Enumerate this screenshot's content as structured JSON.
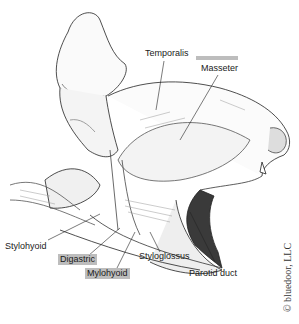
{
  "figure": {
    "labels": [
      {
        "id": "temporalis",
        "text": "Temporalis",
        "highlighted": false
      },
      {
        "id": "masseter",
        "text": "Masseter",
        "highlighted": true
      },
      {
        "id": "stylohyoid",
        "text": "Stylohyoid",
        "highlighted": false
      },
      {
        "id": "digastric",
        "text": "Digastric",
        "highlighted": true
      },
      {
        "id": "mylohyoid",
        "text": "Mylohyoid",
        "highlighted": true
      },
      {
        "id": "styloglossus",
        "text": "Styloglossus",
        "highlighted": false
      },
      {
        "id": "parotid_duct",
        "text": "Parotid duct",
        "highlighted": false
      }
    ],
    "copyright": "© bluedoor, LLC",
    "colors": {
      "highlight": "#bdbdbd",
      "ink": "#1a1a1a",
      "background": "#ffffff"
    }
  }
}
